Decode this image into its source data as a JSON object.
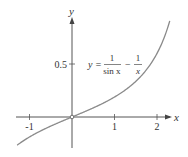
{
  "chart_data": {
    "type": "line",
    "title": "",
    "function": "y = 1/sin x - 1/x",
    "annotation": {
      "prefix": "y =",
      "term1_num": "1",
      "term1_den": "sin x",
      "minus": "−",
      "term2_num": "1",
      "term2_den": "x"
    },
    "xlabel": "x",
    "ylabel": "y",
    "x_ticks": [
      {
        "value": -1,
        "label": "-1"
      },
      {
        "value": 1,
        "label": "1"
      },
      {
        "value": 2,
        "label": "2"
      }
    ],
    "y_ticks": [
      {
        "value": 0.5,
        "label": "0.5"
      }
    ],
    "xlim": [
      -1.3,
      2.3
    ],
    "ylim": [
      -0.27,
      0.91
    ],
    "grid": false,
    "open_point": {
      "x": 0,
      "y": 0
    },
    "series": [
      {
        "name": "1/sin x - 1/x",
        "x_range": [
          -1.29,
          2.3
        ],
        "color": "#888888"
      }
    ]
  }
}
